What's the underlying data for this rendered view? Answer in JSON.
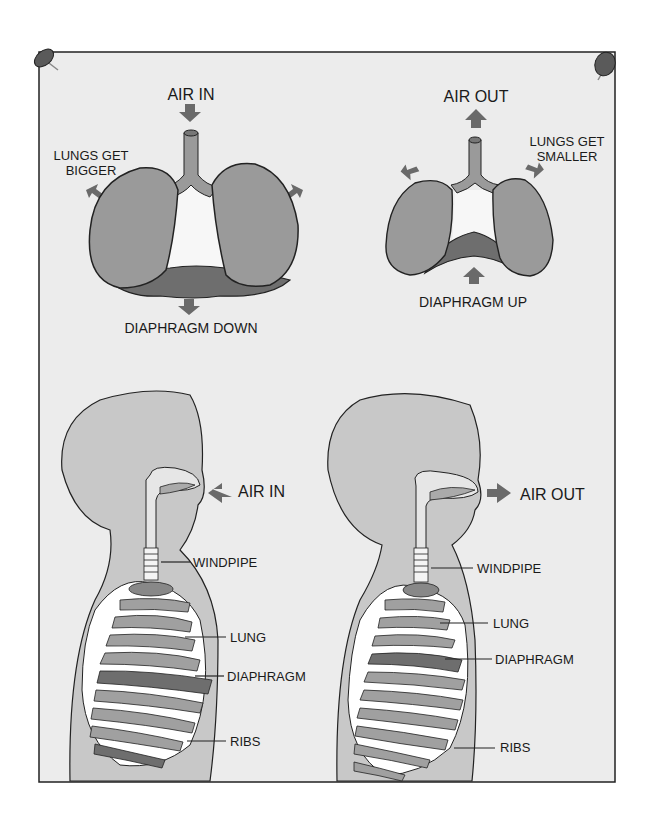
{
  "top_left": {
    "title": "AIR IN",
    "side_label_line1": "LUNGS GET",
    "side_label_line2": "BIGGER",
    "bottom_label": "DIAPHRAGM DOWN"
  },
  "top_right": {
    "title": "AIR OUT",
    "side_label_line1": "LUNGS GET",
    "side_label_line2": "SMALLER",
    "bottom_label": "DIAPHRAGM UP"
  },
  "bottom_left": {
    "air_label": "AIR IN",
    "labels": [
      "WINDPIPE",
      "LUNG",
      "DIAPHRAGM",
      "RIBS"
    ]
  },
  "bottom_right": {
    "air_label": "AIR OUT",
    "labels": [
      "WINDPIPE",
      "LUNG",
      "DIAPHRAGM",
      "RIBS"
    ]
  },
  "colors": {
    "paper": "#ececec",
    "organ": "#9a9a9a",
    "diaphragm": "#6e6e6e",
    "arrow": "#6a6a6a",
    "skin": "#c8c8c8",
    "outline": "#222222"
  }
}
